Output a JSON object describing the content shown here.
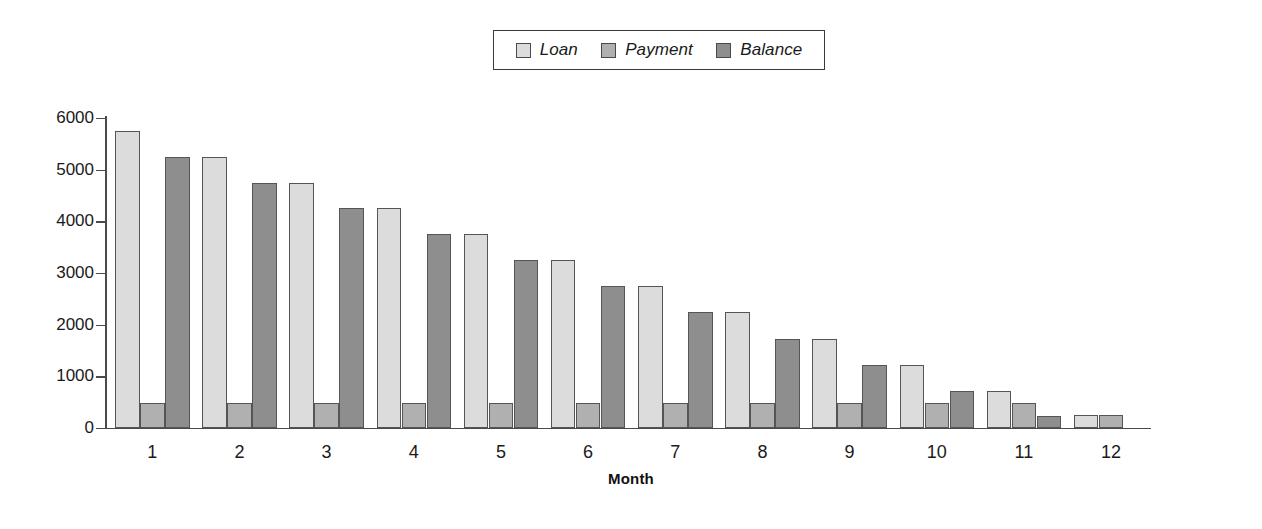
{
  "chart_data": {
    "type": "bar",
    "title": "",
    "subtitle": "",
    "xlabel": "Month",
    "ylabel": "",
    "categories": [
      "1",
      "2",
      "3",
      "4",
      "5",
      "6",
      "7",
      "8",
      "9",
      "10",
      "11",
      "12"
    ],
    "series": [
      {
        "name": "Loan",
        "color": "#dcdcdc",
        "values": [
          5750,
          5250,
          4750,
          4250,
          3750,
          3250,
          2750,
          2250,
          1720,
          1220,
          720,
          250
        ]
      },
      {
        "name": "Payment",
        "color": "#b0b0b0",
        "values": [
          490,
          490,
          490,
          490,
          490,
          490,
          480,
          480,
          480,
          480,
          480,
          250
        ]
      },
      {
        "name": "Balance",
        "color": "#8e8e8e",
        "values": [
          5250,
          4750,
          4250,
          3750,
          3250,
          2750,
          2250,
          1720,
          1220,
          720,
          225,
          0
        ]
      }
    ],
    "ylim": [
      0,
      6000
    ],
    "ytick_values": [
      0,
      1000,
      2000,
      3000,
      4000,
      5000,
      6000
    ],
    "ytick_labels": [
      "0",
      "1000",
      "2000",
      "3000",
      "4000",
      "5000",
      "6000"
    ],
    "grid": false,
    "legend_position": "top-center",
    "legend_entries": [
      "Loan",
      "Payment",
      "Balance"
    ]
  }
}
